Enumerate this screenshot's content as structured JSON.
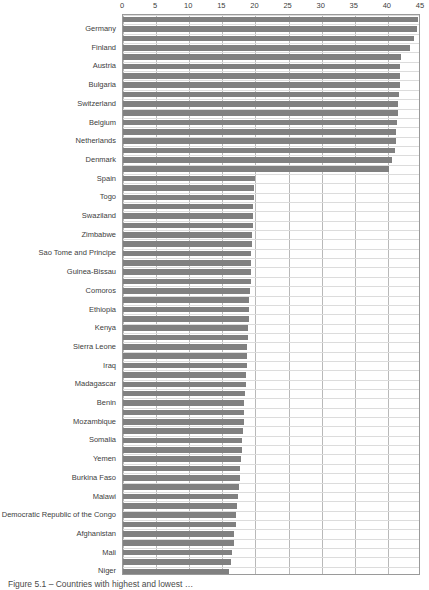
{
  "chart_data": {
    "type": "bar",
    "orientation": "horizontal",
    "title": "",
    "xlabel": "",
    "ylabel": "",
    "xlim": [
      0,
      45
    ],
    "xticks": [
      0,
      5,
      10,
      15,
      20,
      25,
      30,
      35,
      40,
      45
    ],
    "grid": true,
    "legend": "none",
    "bar_color": "#808080",
    "gridline_color": "#b9b9b9",
    "note": "Each country category is rendered as a pair of adjacent bars of nearly equal length.",
    "categories": [
      "Germany",
      "Finland",
      "Austria",
      "Bulgaria",
      "Switzerland",
      "Belgium",
      "Netherlands",
      "Denmark",
      "Spain",
      "Togo",
      "Swaziland",
      "Zimbabwe",
      "Sao Tome and Principe",
      "Guinea-Bissau",
      "Comoros",
      "Ethiopia",
      "Kenya",
      "Sierra Leone",
      "Iraq",
      "Madagascar",
      "Benin",
      "Mozambique",
      "Somalia",
      "Yemen",
      "Burkina Faso",
      "Malawi",
      "Democratic Republic of the Congo",
      "Afghanistan",
      "Mali",
      "Niger"
    ],
    "series": [
      {
        "name": "Bar A",
        "values": [
          44.6,
          44.0,
          42.0,
          41.9,
          41.7,
          41.5,
          41.3,
          41.0,
          40.2,
          19.8,
          19.7,
          19.6,
          19.5,
          19.4,
          19.3,
          19.1,
          19.0,
          18.9,
          18.8,
          18.6,
          18.4,
          18.2,
          18.1,
          17.9,
          17.7,
          17.5,
          17.2,
          17.0,
          16.7,
          16.3
        ]
      },
      {
        "name": "Bar B",
        "values": [
          44.4,
          43.3,
          41.9,
          41.8,
          41.6,
          41.4,
          41.2,
          40.6,
          19.9,
          19.8,
          19.7,
          19.5,
          19.4,
          19.3,
          19.2,
          19.0,
          18.9,
          18.8,
          18.7,
          18.5,
          18.3,
          18.2,
          18.0,
          17.8,
          17.6,
          17.3,
          17.1,
          16.8,
          16.5,
          16.0
        ]
      }
    ]
  },
  "caption": {
    "text": "Figure 5.1 – Countries with highest and lowest …"
  }
}
